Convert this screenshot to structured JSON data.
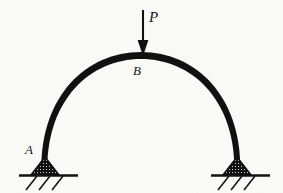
{
  "figure": {
    "kind": "statics-free-body-diagram",
    "background_color": "#fbfbfa",
    "ink_color": "#0d0d0d",
    "width": 283,
    "height": 193
  },
  "labels": {
    "load": "P",
    "crown": "B",
    "left_support": "A"
  },
  "load": {
    "symbol": "P",
    "direction": "down",
    "tail_y": 10,
    "head_y": 54,
    "x": 143
  },
  "arch": {
    "shape": "semicircle",
    "center_x": 141,
    "base_y": 168,
    "radius_x": 96,
    "radius_y": 113,
    "stroke_width_crown": 7,
    "stroke_width_springing": 5,
    "left_springing_x": 45,
    "right_springing_x": 237,
    "crown_y": 55
  },
  "supports": [
    {
      "name": "left-pin-support",
      "label": "A",
      "x": 45,
      "ground_y": 175,
      "triangle_width": 30,
      "triangle_height": 14,
      "ground_line_x1": 20,
      "ground_line_x2": 77,
      "hatch_count": 3
    },
    {
      "name": "right-pin-support",
      "label": "",
      "x": 237,
      "ground_y": 175,
      "triangle_width": 30,
      "triangle_height": 14,
      "ground_line_x1": 212,
      "ground_line_x2": 269,
      "hatch_count": 3
    }
  ]
}
